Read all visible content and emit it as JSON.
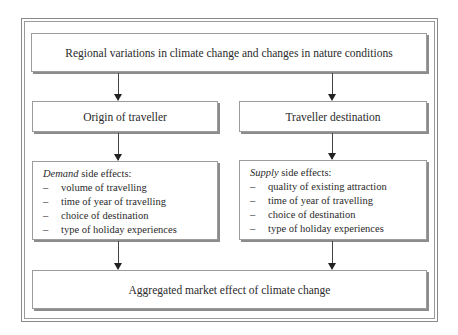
{
  "diagram": {
    "top_box": "Regional variations in climate change and changes in nature conditions",
    "origin_box": "Origin of traveller",
    "destination_box": "Traveller destination",
    "demand": {
      "heading_italic": "Demand",
      "heading_rest": " side effects:",
      "dash": "–",
      "items": [
        "volume of travelling",
        "time of year of travelling",
        "choice of destination",
        "type of holiday experiences"
      ]
    },
    "supply": {
      "heading_italic": "Supply",
      "heading_rest": " side effects:",
      "dash": "–",
      "items": [
        "quality of existing attraction",
        "time of year of travelling",
        "choice of destination",
        "type of holiday experiences"
      ]
    },
    "bottom_box": "Aggregated market effect of climate change"
  },
  "colors": {
    "border": "#9c9c9c",
    "shadow": "#8c8c8c",
    "text": "#2a2a2a",
    "arrow": "#222222"
  }
}
